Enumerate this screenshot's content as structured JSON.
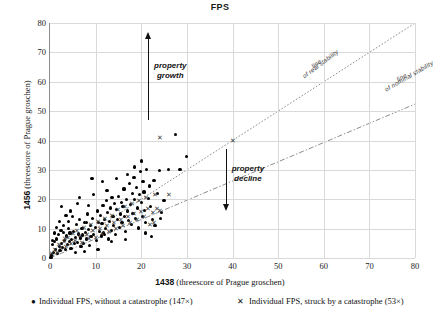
{
  "chart_data": {
    "type": "scatter",
    "title": "FPS",
    "xlabel_bold": "1438",
    "xlabel_rest": " (threescore of Prague groschen)",
    "ylabel_bold": "1456",
    "ylabel_rest": " (threescore of Prague groschen)",
    "xlim": [
      0,
      80
    ],
    "ylim": [
      0,
      80
    ],
    "xticks": [
      0,
      10,
      20,
      30,
      40,
      50,
      60,
      70,
      80
    ],
    "yticks": [
      0,
      10,
      20,
      30,
      40,
      50,
      60,
      70,
      80
    ],
    "grid": true,
    "legend_position": "bottom",
    "annotations": [
      {
        "name": "property-growth",
        "text": "property\ngrowth",
        "line1": "property",
        "line2": "growth"
      },
      {
        "name": "property-decline",
        "text": "property\ndecline",
        "line1": "property",
        "line2": "decline"
      }
    ],
    "reference_lines": [
      {
        "name": "line-of-real-stability",
        "label_line1": "line",
        "label_line2": "of real stability",
        "style": "dotted",
        "slope": 1.0,
        "intercept": 0
      },
      {
        "name": "line-of-nominal-stability",
        "label_line1": "line",
        "label_line2": "of nominal stability",
        "style": "dashdot",
        "slope": 0.655,
        "intercept": 0
      }
    ],
    "series": [
      {
        "name": "without-catastrophe",
        "legend": "Individual FPS, without a catastrophe (147×)",
        "marker": "dot",
        "count": 147,
        "points": [
          [
            0.2,
            0.3
          ],
          [
            0.4,
            1.0
          ],
          [
            0.6,
            4.5
          ],
          [
            0.8,
            2.0
          ],
          [
            1.0,
            5.5
          ],
          [
            1.2,
            3.0
          ],
          [
            1.5,
            6.5
          ],
          [
            1.6,
            1.5
          ],
          [
            1.8,
            8.0
          ],
          [
            2.0,
            4.0
          ],
          [
            2.2,
            2.5
          ],
          [
            2.4,
            9.5
          ],
          [
            2.6,
            5.0
          ],
          [
            2.8,
            3.5
          ],
          [
            3.0,
            11.0
          ],
          [
            3.2,
            6.0
          ],
          [
            3.4,
            2.8
          ],
          [
            3.6,
            7.5
          ],
          [
            3.8,
            4.5
          ],
          [
            4.0,
            12.5
          ],
          [
            4.2,
            5.5
          ],
          [
            4.4,
            8.5
          ],
          [
            4.6,
            3.2
          ],
          [
            4.8,
            6.2
          ],
          [
            5.0,
            14.0
          ],
          [
            5.2,
            9.0
          ],
          [
            5.4,
            4.8
          ],
          [
            5.6,
            7.0
          ],
          [
            5.8,
            11.5
          ],
          [
            6.0,
            5.2
          ],
          [
            6.2,
            8.2
          ],
          [
            6.4,
            13.0
          ],
          [
            6.6,
            6.8
          ],
          [
            6.8,
            3.8
          ],
          [
            7.0,
            10.0
          ],
          [
            7.2,
            7.8
          ],
          [
            7.4,
            5.0
          ],
          [
            7.6,
            12.0
          ],
          [
            7.8,
            8.8
          ],
          [
            8.0,
            6.5
          ],
          [
            8.2,
            15.0
          ],
          [
            8.4,
            9.8
          ],
          [
            8.6,
            4.2
          ],
          [
            8.8,
            11.0
          ],
          [
            9.0,
            7.2
          ],
          [
            9.2,
            27.0
          ],
          [
            9.4,
            13.5
          ],
          [
            9.6,
            8.0
          ],
          [
            10.0,
            10.5
          ],
          [
            10.2,
            6.0
          ],
          [
            10.4,
            16.0
          ],
          [
            10.6,
            12.0
          ],
          [
            10.8,
            9.0
          ],
          [
            11.0,
            14.5
          ],
          [
            11.2,
            7.5
          ],
          [
            11.4,
            11.8
          ],
          [
            11.6,
            18.0
          ],
          [
            11.8,
            8.5
          ],
          [
            12.0,
            13.0
          ],
          [
            12.2,
            10.0
          ],
          [
            12.4,
            19.5
          ],
          [
            12.6,
            15.5
          ],
          [
            12.8,
            6.5
          ],
          [
            13.0,
            12.5
          ],
          [
            13.2,
            17.0
          ],
          [
            13.4,
            9.5
          ],
          [
            13.6,
            20.5
          ],
          [
            13.8,
            14.0
          ],
          [
            14.0,
            11.0
          ],
          [
            14.2,
            18.5
          ],
          [
            14.4,
            8.0
          ],
          [
            14.6,
            16.5
          ],
          [
            14.8,
            13.2
          ],
          [
            15.0,
            21.0
          ],
          [
            15.2,
            10.5
          ],
          [
            15.4,
            15.0
          ],
          [
            15.6,
            19.0
          ],
          [
            15.8,
            12.0
          ],
          [
            16.0,
            17.5
          ],
          [
            16.2,
            23.5
          ],
          [
            16.4,
            14.2
          ],
          [
            16.6,
            9.0
          ],
          [
            16.8,
            20.0
          ],
          [
            17.0,
            16.0
          ],
          [
            17.2,
            12.8
          ],
          [
            17.4,
            25.5
          ],
          [
            17.6,
            18.2
          ],
          [
            17.8,
            11.5
          ],
          [
            18.0,
            22.0
          ],
          [
            18.2,
            15.2
          ],
          [
            18.4,
            27.5
          ],
          [
            18.6,
            19.8
          ],
          [
            18.8,
            13.5
          ],
          [
            19.0,
            24.0
          ],
          [
            19.2,
            17.0
          ],
          [
            19.4,
            10.2
          ],
          [
            19.6,
            21.5
          ],
          [
            19.8,
            29.5
          ],
          [
            20.0,
            18.8
          ],
          [
            20.2,
            14.0
          ],
          [
            20.4,
            26.0
          ],
          [
            20.6,
            22.5
          ],
          [
            20.8,
            16.2
          ],
          [
            21.0,
            12.2
          ],
          [
            21.2,
            30.0
          ],
          [
            21.5,
            20.2
          ],
          [
            21.8,
            24.5
          ],
          [
            22.0,
            17.5
          ],
          [
            22.2,
            7.2
          ],
          [
            22.5,
            13.0
          ],
          [
            22.8,
            26.5
          ],
          [
            23.0,
            11.0
          ],
          [
            23.5,
            22.0
          ],
          [
            24.0,
            29.8
          ],
          [
            24.5,
            15.5
          ],
          [
            25.0,
            19.5
          ],
          [
            26.0,
            30.0
          ],
          [
            27.5,
            42.0
          ],
          [
            28.5,
            30.2
          ],
          [
            30.0,
            34.5
          ],
          [
            2.5,
            17.5
          ],
          [
            3.5,
            14.5
          ],
          [
            1.4,
            10.5
          ],
          [
            6.5,
            20.5
          ],
          [
            8.5,
            18.0
          ],
          [
            4.5,
            16.0
          ],
          [
            9.5,
            21.5
          ],
          [
            12.5,
            23.0
          ],
          [
            5.5,
            2.0
          ],
          [
            7.5,
            2.2
          ],
          [
            10.5,
            3.0
          ],
          [
            13.5,
            5.5
          ],
          [
            16.5,
            6.2
          ],
          [
            2.0,
            12.5
          ],
          [
            3.0,
            8.8
          ],
          [
            6.0,
            18.5
          ],
          [
            11.5,
            26.0
          ],
          [
            14.5,
            27.0
          ],
          [
            18.5,
            31.0
          ],
          [
            21.0,
            8.5
          ],
          [
            24.2,
            13.5
          ],
          [
            1.0,
            8.5
          ],
          [
            0.5,
            6.0
          ],
          [
            4.0,
            10.0
          ],
          [
            8.0,
            12.0
          ],
          [
            12.0,
            8.0
          ],
          [
            17.0,
            28.5
          ],
          [
            20.0,
            33.0
          ]
        ]
      },
      {
        "name": "struck-by-catastrophe",
        "legend": "Individual FPS, struck by a catastrophe (53×)",
        "marker": "cross",
        "count": 53,
        "points": [
          [
            0.5,
            1.5
          ],
          [
            1.0,
            3.0
          ],
          [
            1.5,
            2.0
          ],
          [
            2.0,
            4.5
          ],
          [
            2.5,
            3.5
          ],
          [
            3.0,
            5.5
          ],
          [
            3.2,
            6.5
          ],
          [
            3.5,
            4.0
          ],
          [
            4.0,
            7.0
          ],
          [
            4.5,
            5.0
          ],
          [
            5.0,
            8.5
          ],
          [
            5.5,
            6.0
          ],
          [
            6.0,
            9.5
          ],
          [
            6.5,
            7.5
          ],
          [
            7.0,
            5.2
          ],
          [
            7.5,
            10.5
          ],
          [
            8.0,
            8.0
          ],
          [
            8.5,
            6.8
          ],
          [
            9.0,
            11.5
          ],
          [
            9.5,
            9.2
          ],
          [
            10.0,
            7.0
          ],
          [
            10.5,
            12.5
          ],
          [
            11.0,
            10.0
          ],
          [
            11.5,
            8.2
          ],
          [
            12.0,
            13.5
          ],
          [
            12.5,
            11.0
          ],
          [
            13.0,
            9.0
          ],
          [
            13.5,
            14.5
          ],
          [
            14.0,
            12.0
          ],
          [
            14.5,
            10.2
          ],
          [
            15.0,
            16.5
          ],
          [
            15.5,
            13.0
          ],
          [
            16.0,
            11.2
          ],
          [
            16.5,
            17.5
          ],
          [
            17.0,
            14.0
          ],
          [
            17.5,
            12.2
          ],
          [
            18.0,
            18.5
          ],
          [
            18.5,
            15.0
          ],
          [
            19.0,
            13.2
          ],
          [
            19.5,
            19.5
          ],
          [
            20.0,
            16.0
          ],
          [
            20.5,
            14.2
          ],
          [
            21.0,
            20.5
          ],
          [
            21.5,
            17.0
          ],
          [
            22.0,
            11.5
          ],
          [
            22.5,
            15.5
          ],
          [
            22.8,
            12.0
          ],
          [
            23.0,
            21.5
          ],
          [
            23.5,
            16.8
          ],
          [
            24.0,
            41.0
          ],
          [
            24.2,
            16.2
          ],
          [
            26.0,
            21.5
          ],
          [
            40.0,
            40.0
          ]
        ]
      }
    ]
  }
}
